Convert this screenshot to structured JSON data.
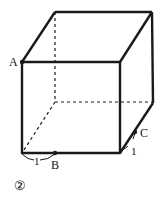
{
  "figure": {
    "number_label": "②",
    "points": {
      "A": "A",
      "B": "B",
      "C": "C"
    },
    "measures": {
      "front_bottom_left_to_B": "1",
      "front_bottom_right_to_C": "1"
    },
    "line_color": "#1a1a1a",
    "background": "#ffffff"
  }
}
